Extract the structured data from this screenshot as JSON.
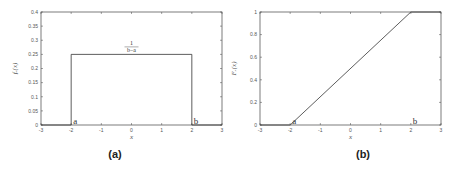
{
  "chart_data": [
    {
      "type": "line",
      "panel": "a",
      "caption": "(a)",
      "title": "",
      "xlabel": "x",
      "ylabel": "f_X(x)",
      "xlim": [
        -3,
        3
      ],
      "ylim": [
        0,
        0.4
      ],
      "xticks": [
        -3,
        -2,
        -1,
        0,
        1,
        2,
        3
      ],
      "yticks": [
        0,
        0.05,
        0.1,
        0.15,
        0.2,
        0.25,
        0.3,
        0.35,
        0.4
      ],
      "ytick_labels": [
        "0",
        "0.05",
        "0.1",
        "0.15",
        "0.2",
        "0.25",
        "0.3",
        "0.35",
        "0.4"
      ],
      "grid": false,
      "series": [
        {
          "name": "uniform pdf",
          "x": [
            -3,
            -2,
            -2,
            2,
            2,
            3
          ],
          "y": [
            0,
            0,
            0.25,
            0.25,
            0,
            0
          ]
        }
      ],
      "annotations": [
        {
          "text": "a",
          "x": -2,
          "y": 0
        },
        {
          "text": "b",
          "x": 2,
          "y": 0
        },
        {
          "text_num": "1",
          "text_den": "b−a",
          "x": 0,
          "y": 0.25
        }
      ]
    },
    {
      "type": "line",
      "panel": "b",
      "caption": "(b)",
      "title": "",
      "xlabel": "x",
      "ylabel": "F_X(x)",
      "xlim": [
        -3,
        3
      ],
      "ylim": [
        0,
        1
      ],
      "xticks": [
        -3,
        -2,
        -1,
        0,
        1,
        2,
        3
      ],
      "yticks": [
        0,
        0.2,
        0.4,
        0.6,
        0.8,
        1
      ],
      "ytick_labels": [
        "0",
        "0.2",
        "0.4",
        "0.6",
        "0.8",
        "1"
      ],
      "grid": false,
      "series": [
        {
          "name": "uniform cdf",
          "x": [
            -3,
            -2,
            2,
            3
          ],
          "y": [
            0,
            0,
            1,
            1
          ]
        }
      ],
      "annotations": [
        {
          "text": "a",
          "x": -2,
          "y": 0
        },
        {
          "text": "b",
          "x": 2,
          "y": 0
        }
      ]
    }
  ]
}
